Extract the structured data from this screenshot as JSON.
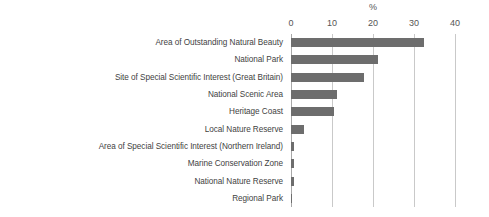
{
  "chart_data": {
    "type": "bar",
    "orientation": "horizontal",
    "title": "",
    "axis_title": "%",
    "xlabel": "%",
    "ylabel": "",
    "xlim": [
      0,
      40
    ],
    "xticks": [
      0,
      10,
      20,
      30,
      40
    ],
    "xtick_labels": [
      "0",
      "10",
      "20",
      "30",
      "40"
    ],
    "grid": "vertical",
    "legend": "none",
    "bar_color": "#6d6d6d",
    "gridline_color": "#c9c9c9",
    "categories": [
      "Area of Outstanding Natural Beauty",
      "National Park",
      "Site of Special Scientific Interest (Great Britain)",
      "National Scenic Area",
      "Heritage Coast",
      "Local Nature Reserve",
      "Area of Special Scientific Interest (Northern Ireland)",
      "Marine Conservation Zone",
      "National Nature Reserve",
      "Regional Park"
    ],
    "values": [
      32.5,
      21.2,
      17.8,
      11.2,
      10.5,
      3.2,
      0.8,
      0.8,
      0.8,
      0.2
    ]
  }
}
